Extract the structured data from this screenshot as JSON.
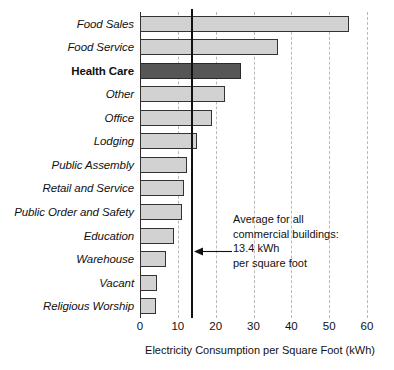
{
  "chart_data": {
    "type": "bar",
    "orientation": "horizontal",
    "title": "",
    "xlabel": "Electricity Consumption per Square Foot (kWh)",
    "ylabel": "",
    "xlim": [
      0,
      60
    ],
    "xticks": [
      0,
      10,
      20,
      30,
      40,
      50,
      60
    ],
    "grid": "vertical dashed gridlines at each x tick",
    "legend": "none",
    "categories": [
      "Food Sales",
      "Food Service",
      "Health Care",
      "Other",
      "Office",
      "Lodging",
      "Public Assembly",
      "Retail and Service",
      "Public Order and Safety",
      "Education",
      "Warehouse",
      "Vacant",
      "Religious Worship"
    ],
    "values": [
      55.2,
      36.5,
      26.8,
      22.4,
      19.1,
      15.0,
      12.3,
      11.7,
      11.2,
      9.0,
      6.8,
      4.5,
      4.2
    ],
    "highlighted_category": "Health Care",
    "colors": {
      "bar_fill": "#d2d2d2",
      "bar_border": "#333333",
      "highlight_fill": "#565656",
      "gridline": "#b9b9b9",
      "axis": "#2b2b2b",
      "average_line": "#111111",
      "text": "#111111"
    },
    "reference_line": {
      "value": 13.4,
      "label": "Average for all commercial buildings: 13.4 kWh per square foot"
    },
    "annotation": {
      "line1": "Average for all",
      "line2": "commercial buildings:",
      "line3": "13.4 kWh",
      "line4": "per square foot"
    }
  }
}
